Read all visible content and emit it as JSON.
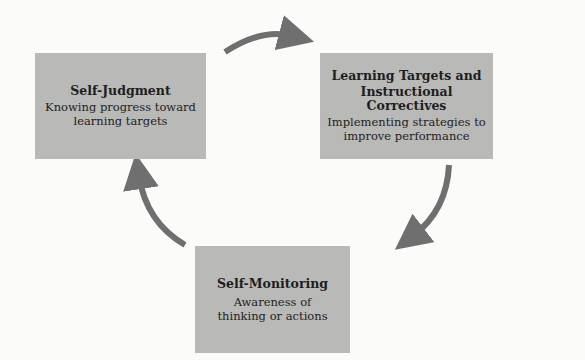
{
  "diagram": {
    "type": "cycle",
    "box_color": "#b9b9b7",
    "arrow_color": "#6f6f6f",
    "nodes": [
      {
        "id": "self-judgment",
        "title": "Self-Judgment",
        "description_lines": [
          "Knowing progress toward",
          "learning targets"
        ]
      },
      {
        "id": "learning-targets",
        "title_lines": [
          "Learning Targets and",
          "Instructional Correctives"
        ],
        "description_lines": [
          "Implementing strategies to",
          "improve performance"
        ]
      },
      {
        "id": "self-monitoring",
        "title": "Self-Monitoring",
        "description_lines": [
          "Awareness of",
          "thinking or actions"
        ]
      }
    ],
    "edges": [
      {
        "from": "self-judgment",
        "to": "learning-targets"
      },
      {
        "from": "learning-targets",
        "to": "self-monitoring"
      },
      {
        "from": "self-monitoring",
        "to": "self-judgment"
      }
    ]
  }
}
